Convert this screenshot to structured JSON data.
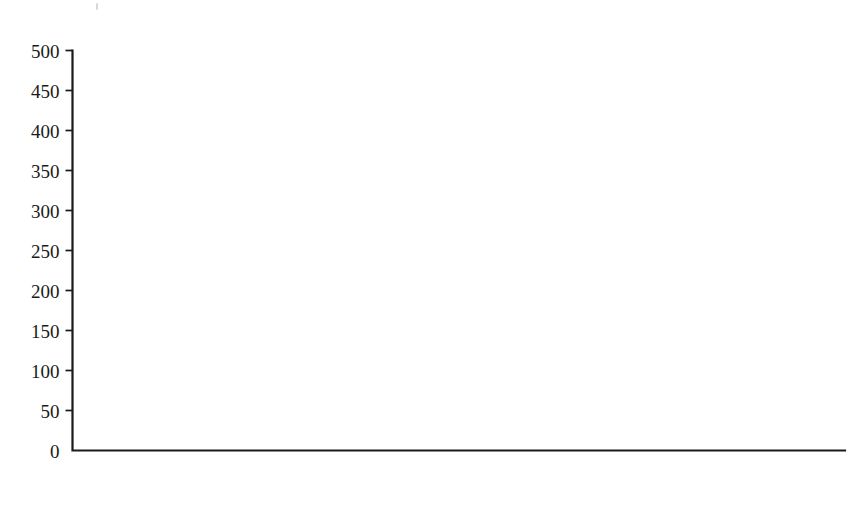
{
  "chart_data": {
    "type": "line",
    "title": "",
    "subtitle": "",
    "xlabel": "",
    "ylabel": "",
    "xlim": [
      1930,
      2009
    ],
    "ylim": [
      0,
      500
    ],
    "grid": false,
    "legend": null,
    "y_ticks": [
      0,
      50,
      100,
      150,
      200,
      250,
      300,
      350,
      400,
      450,
      500
    ],
    "y_tick_labels": [
      "0",
      "50",
      "100",
      "150",
      "200",
      "250",
      "300",
      "350",
      "400",
      "450",
      "500"
    ],
    "x_ticks": [
      1930,
      1933,
      1936,
      1939,
      1942,
      1945,
      1948,
      1951,
      1954,
      1957,
      1960,
      1963,
      1966,
      1969,
      1972,
      1975,
      1978,
      1981,
      1984,
      1987,
      1990,
      1993,
      1996,
      1999,
      2002,
      2005,
      2008
    ],
    "x_tick_labels": [
      "1930",
      "1933",
      "1936",
      "1939",
      "1942",
      "1945",
      "1948",
      "1951",
      "1954",
      "1957",
      "1960",
      "1963",
      "1966",
      "1969",
      "1972",
      "1975",
      "1978",
      "1981",
      "1984",
      "1987",
      "1990",
      "1993",
      "1996",
      "1999",
      "2002",
      "2005",
      "2008"
    ],
    "x_tick_interval_years": 3,
    "x_minor_tick_interval_years": 1,
    "series": [
      {
        "name": "series-1",
        "color": "#1c1c1c",
        "x": [
          1930,
          1931,
          1932,
          1933,
          1934,
          1935,
          1936,
          1937,
          1938,
          1939,
          1940,
          1941,
          1942,
          1943,
          1944,
          1945,
          1946,
          1947,
          1948,
          1949,
          1950,
          1951,
          1952,
          1953,
          1954,
          1955,
          1956,
          1957,
          1958,
          1959,
          1960,
          1961,
          1962,
          1963,
          1964,
          1965,
          1966,
          1967,
          1968,
          1969,
          1970,
          1971,
          1972,
          1973,
          1974,
          1975,
          1976,
          1977,
          1978,
          1979,
          1980,
          1981,
          1982,
          1983,
          1984,
          1985,
          1986,
          1987,
          1988,
          1989,
          1990,
          1991,
          1992,
          1993,
          1994,
          1995,
          1996,
          1997,
          1998,
          1999,
          2000,
          2001,
          2002,
          2003,
          2004,
          2005,
          2006,
          2007,
          2008,
          2009
        ],
        "values": [
          120,
          119,
          121,
          130,
          140,
          146,
          146,
          137,
          129,
          130,
          128,
          122,
          104,
          82,
          68,
          63,
          63,
          70,
          83,
          93,
          101,
          105,
          105,
          107,
          110,
          115,
          117,
          116,
          118,
          124,
          124,
          133,
          141,
          138,
          146,
          146,
          147,
          143,
          141,
          141,
          138,
          126,
          106,
          96,
          103,
          116,
          95,
          93,
          89,
          86,
          94,
          101,
          113,
          131,
          152,
          172,
          195,
          218,
          248,
          275,
          300,
          322,
          330,
          350,
          378,
          400,
          424,
          448,
          462,
          471,
          469,
          455,
          444,
          444,
          447,
          445,
          458,
          452,
          443,
          435
        ]
      }
    ]
  },
  "axes": {
    "y_axis_name": "y-axis",
    "x_axis_name": "x-axis"
  }
}
